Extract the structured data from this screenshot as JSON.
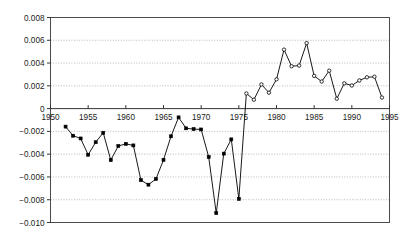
{
  "chart_data": {
    "type": "line",
    "title": "",
    "subtitle": "",
    "xlabel": "",
    "ylabel": "",
    "xlim": [
      1950,
      1995
    ],
    "ylim": [
      -0.01,
      0.008
    ],
    "grid": "horizontal-dotted",
    "legend": "none",
    "xticks": [
      1950,
      1955,
      1960,
      1965,
      1970,
      1975,
      1980,
      1985,
      1990,
      1995
    ],
    "xtick_labels": [
      "1950",
      "1955",
      "1960",
      "1965",
      "1970",
      "1975",
      "1980",
      "1985",
      "1990",
      "1995"
    ],
    "yticks": [
      0.008,
      0.006,
      0.004,
      0.002,
      0,
      -0.002,
      -0.004,
      -0.006,
      -0.008,
      -0.01
    ],
    "ytick_labels": [
      "0.008",
      "0.006",
      "0.004",
      "0.002",
      "0",
      "-0.002",
      "-0.004",
      "-0.006",
      "-0.008",
      "-0.010"
    ],
    "axis_label_position": "x-axis labels drawn below the zero line inside the plot frame",
    "marker_note": "filled markers for negative segment, open circle markers for positive segment",
    "series": [
      {
        "name": "series-1",
        "marker_negative": "filled-square",
        "marker_positive": "open-circle",
        "color": "#000000",
        "x": [
          1952,
          1953,
          1954,
          1955,
          1956,
          1957,
          1958,
          1959,
          1960,
          1961,
          1962,
          1963,
          1964,
          1965,
          1966,
          1967,
          1968,
          1969,
          1970,
          1971,
          1972,
          1973,
          1974,
          1975,
          1976,
          1977,
          1978,
          1979,
          1980,
          1981,
          1982,
          1983,
          1984,
          1985,
          1986,
          1987,
          1988,
          1989,
          1990,
          1991,
          1992,
          1993,
          1994
        ],
        "values": [
          -0.00158,
          -0.00238,
          -0.00262,
          -0.00405,
          -0.00295,
          -0.00212,
          -0.00452,
          -0.00328,
          -0.0031,
          -0.00323,
          -0.00628,
          -0.00668,
          -0.00618,
          -0.0045,
          -0.00243,
          -0.00077,
          -0.00173,
          -0.0018,
          -0.00183,
          -0.00425,
          -0.00918,
          -0.00395,
          -0.0027,
          -0.00793,
          0.00133,
          0.00078,
          0.00212,
          0.0014,
          0.00257,
          0.00518,
          0.00372,
          0.00378,
          0.00575,
          0.00287,
          0.00238,
          0.00333,
          0.00087,
          0.00222,
          0.00203,
          0.00247,
          0.00275,
          0.0028,
          0.00097
        ],
        "zero_crossing_year": 1975,
        "zero_crossing_value": 0
      }
    ],
    "annotations": [
      {
        "text": "deepest trough",
        "x": 1972,
        "y": -0.00918
      },
      {
        "text": "highest peak",
        "x": 1984,
        "y": 0.00575
      }
    ]
  }
}
